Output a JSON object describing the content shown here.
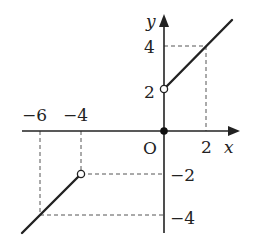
{
  "figure": {
    "type": "piecewise-function-graph",
    "axes": {
      "x_label": "x",
      "y_label": "y",
      "origin_label": "O",
      "x_ticks": [
        {
          "value": -6,
          "label": "−6"
        },
        {
          "value": -4,
          "label": "−4"
        },
        {
          "value": 2,
          "label": "2"
        }
      ],
      "y_ticks": [
        {
          "value": 4,
          "label": "4"
        },
        {
          "value": 2,
          "label": "2"
        },
        {
          "value": -2,
          "label": "−2"
        },
        {
          "value": -4,
          "label": "−4"
        }
      ]
    },
    "pieces": [
      {
        "domain": "x < -4",
        "formula": "y = x + 2",
        "from": [
          -6.6,
          -4.6
        ],
        "to": [
          -4,
          -2
        ],
        "end": "open"
      },
      {
        "domain": "x = 0",
        "point": [
          0,
          0
        ],
        "marker": "closed"
      },
      {
        "domain": "x > 0",
        "formula": "y = x + 2",
        "from": [
          0,
          2
        ],
        "to": [
          3.3,
          5.3
        ],
        "start": "open"
      }
    ],
    "guide_points": [
      [
        -6,
        -4
      ],
      [
        -4,
        -2
      ],
      [
        2,
        4
      ]
    ],
    "colors": {
      "line": "#222222",
      "guide": "#555555",
      "background": "#ffffff"
    }
  }
}
